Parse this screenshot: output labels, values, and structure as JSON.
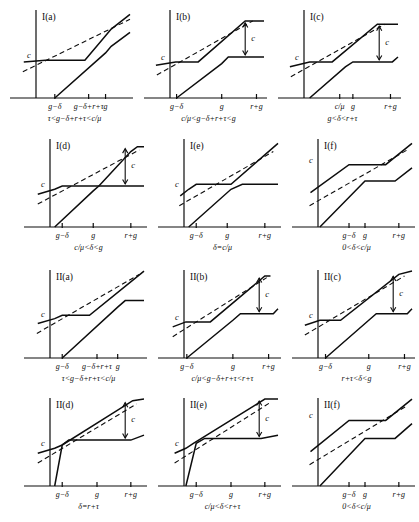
{
  "figure": {
    "kind": "piecewise-linear-case-diagrams",
    "panel_count": 12
  },
  "chart_data": {
    "type": "line",
    "title": "",
    "xlabel": "",
    "ylabel": "",
    "grid": false,
    "legend": "none",
    "panels": [
      {
        "id": "I-a",
        "title": "I(a)",
        "condition": "τ<g−δ+r+τ<c/μ",
        "level_label": "c",
        "has_c_bracket": false,
        "ticks": [
          "g−δ",
          "g−δ+r+τ",
          "g"
        ],
        "tick_x": [
          0.2,
          0.56,
          0.74
        ],
        "upper_series": {
          "name": "upper",
          "x": [
            -0.13,
            0.1,
            0.52,
            0.74,
            0.8,
            1.0
          ],
          "y": [
            0.44,
            0.46,
            0.46,
            0.76,
            0.84,
            1.02
          ]
        },
        "lower_series": {
          "name": "lower",
          "x": [
            0.2,
            0.74,
            0.8,
            1.0
          ],
          "y": [
            0.0,
            0.55,
            0.63,
            0.8
          ]
        },
        "dashed_series": {
          "name": "reference",
          "x": [
            -0.14,
            1.0
          ],
          "y": [
            0.32,
            0.96
          ]
        }
      },
      {
        "id": "I-b",
        "title": "I(b)",
        "condition": "c/μ<g−δ+r+τ<g",
        "level_label": "c",
        "has_c_bracket": true,
        "ticks": [
          "g−δ",
          "g",
          "r+g"
        ],
        "tick_x": [
          0.07,
          0.55,
          0.92
        ],
        "upper_series": {
          "name": "upper",
          "x": [
            -0.15,
            0.06,
            0.3,
            0.8,
            1.0
          ],
          "y": [
            0.4,
            0.44,
            0.44,
            0.94,
            0.94
          ]
        },
        "lower_series": {
          "name": "lower",
          "x": [
            0.07,
            0.55,
            0.62,
            1.0
          ],
          "y": [
            0.0,
            0.42,
            0.5,
            0.5
          ]
        },
        "dashed_series": {
          "name": "reference",
          "x": [
            -0.14,
            0.88
          ],
          "y": [
            0.28,
            0.94
          ]
        }
      },
      {
        "id": "I-c",
        "title": "I(c)",
        "condition": "g<δ<r+τ",
        "level_label": "c",
        "has_c_bracket": true,
        "ticks": [
          "c/μ",
          "g",
          "r+g"
        ],
        "tick_x": [
          0.38,
          0.52,
          0.92
        ],
        "upper_series": {
          "name": "upper",
          "x": [
            -0.15,
            0.06,
            0.3,
            0.78,
            1.0
          ],
          "y": [
            0.38,
            0.44,
            0.44,
            0.9,
            0.9
          ]
        },
        "lower_series": {
          "name": "lower",
          "x": [
            0.06,
            0.44,
            0.52,
            0.94,
            1.0
          ],
          "y": [
            0.0,
            0.38,
            0.44,
            0.44,
            0.5
          ]
        },
        "dashed_series": {
          "name": "reference",
          "x": [
            -0.14,
            0.86
          ],
          "y": [
            0.26,
            0.9
          ]
        }
      },
      {
        "id": "I-d",
        "title": "I(d)",
        "condition": "c/μ<δ<g",
        "level_label": "c",
        "has_c_bracket": true,
        "ticks": [
          "g−δ",
          "g",
          "r+g"
        ],
        "tick_x": [
          0.13,
          0.46,
          0.86
        ],
        "upper_series": {
          "name": "upper",
          "x": [
            -0.13,
            0.05,
            0.13,
            0.52,
            0.86,
            0.93,
            1.0
          ],
          "y": [
            0.4,
            0.46,
            0.5,
            0.5,
            0.92,
            0.98,
            0.98
          ]
        },
        "lower_series": {
          "name": "lower",
          "x": [
            0.05,
            0.46,
            0.52,
            0.86,
            1.0
          ],
          "y": [
            0.0,
            0.44,
            0.5,
            0.5,
            0.5
          ]
        },
        "dashed_series": {
          "name": "reference",
          "x": [
            -0.13,
            0.95
          ],
          "y": [
            0.28,
            0.94
          ]
        }
      },
      {
        "id": "I-e",
        "title": "I(e)",
        "condition": "δ=c/μ",
        "level_label": "c",
        "has_c_bracket": false,
        "ticks": [
          "g−δ",
          "g",
          "r+g"
        ],
        "tick_x": [
          0.13,
          0.46,
          0.86
        ],
        "upper_series": {
          "name": "upper",
          "x": [
            -0.04,
            0.05,
            0.13,
            0.5,
            1.0
          ],
          "y": [
            0.38,
            0.46,
            0.52,
            0.52,
            1.02
          ]
        },
        "lower_series": {
          "name": "lower",
          "x": [
            0.05,
            0.5,
            0.62,
            1.0
          ],
          "y": [
            0.0,
            0.46,
            0.52,
            0.52
          ]
        },
        "dashed_series": {
          "name": "reference",
          "x": [
            -0.05,
            0.95
          ],
          "y": [
            0.26,
            0.92
          ]
        }
      },
      {
        "id": "I-f",
        "title": "I(f)",
        "condition": "0<δ<c/μ",
        "level_label": "c",
        "has_c_bracket": false,
        "ticks": [
          "g−δ",
          "g",
          "r+g"
        ],
        "tick_x": [
          0.33,
          0.5,
          0.86
        ],
        "upper_series": {
          "name": "upper",
          "x": [
            -0.08,
            0.33,
            0.72,
            1.0
          ],
          "y": [
            0.42,
            0.76,
            0.76,
            1.02
          ]
        },
        "lower_series": {
          "name": "lower",
          "x": [
            0.02,
            0.5,
            0.82,
            1.0
          ],
          "y": [
            0.0,
            0.56,
            0.56,
            0.72
          ]
        },
        "dashed_series": {
          "name": "reference",
          "x": [
            -0.09,
            0.95
          ],
          "y": [
            0.26,
            0.94
          ]
        }
      },
      {
        "id": "II-a",
        "title": "II(a)",
        "condition": "τ<g−δ+r+τ<c/μ",
        "level_label": "c",
        "has_c_bracket": false,
        "ticks": [
          "g−δ",
          "g−δ+r+τ",
          "g"
        ],
        "tick_x": [
          0.13,
          0.5,
          0.72
        ],
        "upper_series": {
          "name": "upper",
          "x": [
            -0.13,
            0.05,
            0.13,
            0.42,
            1.0
          ],
          "y": [
            0.42,
            0.48,
            0.52,
            0.52,
            1.06
          ]
        },
        "lower_series": {
          "name": "lower",
          "x": [
            0.13,
            0.72,
            0.8,
            1.0
          ],
          "y": [
            0.0,
            0.62,
            0.7,
            0.7
          ]
        },
        "dashed_series": {
          "name": "reference",
          "x": [
            -0.14,
            0.95
          ],
          "y": [
            0.3,
            1.02
          ]
        }
      },
      {
        "id": "II-b",
        "title": "II(b)",
        "condition": "c/μ<g−δ+r+τ<r+τ",
        "level_label": "c",
        "has_c_bracket": true,
        "ticks": [
          "g−δ",
          "g",
          "r+g"
        ],
        "tick_x": [
          0.03,
          0.52,
          0.9
        ],
        "upper_series": {
          "name": "upper",
          "x": [
            -0.12,
            0.02,
            0.28,
            0.86,
            0.92
          ],
          "y": [
            0.38,
            0.44,
            0.44,
            1.0,
            1.0
          ]
        },
        "lower_series": {
          "name": "lower",
          "x": [
            0.03,
            0.52,
            0.6,
            0.95,
            1.0
          ],
          "y": [
            0.0,
            0.46,
            0.54,
            0.54,
            0.6
          ]
        },
        "dashed_series": {
          "name": "reference",
          "x": [
            -0.12,
            0.88
          ],
          "y": [
            0.26,
            0.98
          ]
        }
      },
      {
        "id": "II-c",
        "title": "II(c)",
        "condition": "r+τ<δ<g",
        "level_label": "c",
        "has_c_bracket": true,
        "ticks": [
          "g−δ",
          "g",
          "r+g"
        ],
        "tick_x": [
          0.08,
          0.54,
          0.92
        ],
        "upper_series": {
          "name": "upper",
          "x": [
            -0.14,
            0.02,
            0.24,
            0.86,
            1.0
          ],
          "y": [
            0.4,
            0.46,
            0.46,
            1.02,
            1.06
          ]
        },
        "lower_series": {
          "name": "lower",
          "x": [
            0.08,
            0.54,
            0.62,
            0.95,
            1.0
          ],
          "y": [
            0.0,
            0.46,
            0.54,
            0.54,
            0.6
          ]
        },
        "dashed_series": {
          "name": "reference",
          "x": [
            -0.14,
            0.92
          ],
          "y": [
            0.28,
            1.0
          ]
        }
      },
      {
        "id": "II-d",
        "title": "II(d)",
        "condition": "δ=r+τ",
        "level_label": "c",
        "has_c_bracket": true,
        "ticks": [
          "g−δ",
          "g",
          "r+g"
        ],
        "tick_x": [
          0.13,
          0.5,
          0.86
        ],
        "upper_series": {
          "name": "upper",
          "x": [
            -0.13,
            0.05,
            0.13,
            0.88,
            1.0
          ],
          "y": [
            0.4,
            0.46,
            0.5,
            1.04,
            1.06
          ]
        },
        "lower_series": {
          "name": "lower",
          "x": [
            0.05,
            0.13,
            0.2,
            0.86,
            1.0
          ],
          "y": [
            0.0,
            0.5,
            0.56,
            0.56,
            0.62
          ]
        },
        "dashed_series": {
          "name": "reference",
          "x": [
            -0.13,
            0.92
          ],
          "y": [
            0.28,
            1.0
          ]
        }
      },
      {
        "id": "II-e",
        "title": "II(e)",
        "condition": "c/μ<δ<r+τ",
        "level_label": "c",
        "has_c_bracket": true,
        "ticks": [
          "g−δ",
          "g",
          "r+g"
        ],
        "tick_x": [
          0.13,
          0.5,
          0.86
        ],
        "upper_series": {
          "name": "upper",
          "x": [
            -0.1,
            0.02,
            0.1,
            0.86,
            1.0
          ],
          "y": [
            0.4,
            0.46,
            0.52,
            1.06,
            1.06
          ]
        },
        "lower_series": {
          "name": "lower",
          "x": [
            0.02,
            0.13,
            0.22,
            0.82,
            1.0
          ],
          "y": [
            0.0,
            0.52,
            0.58,
            0.58,
            0.62
          ]
        },
        "dashed_series": {
          "name": "reference",
          "x": [
            -0.1,
            0.92
          ],
          "y": [
            0.28,
            1.02
          ]
        }
      },
      {
        "id": "II-f",
        "title": "II(f)",
        "condition": "0<δ<c/μ",
        "level_label": "c",
        "has_c_bracket": false,
        "ticks": [
          "g−δ",
          "g",
          "r+g"
        ],
        "tick_x": [
          0.33,
          0.5,
          0.86
        ],
        "upper_series": {
          "name": "upper",
          "x": [
            -0.08,
            0.33,
            0.72,
            1.0
          ],
          "y": [
            0.42,
            0.8,
            0.8,
            1.06
          ]
        },
        "lower_series": {
          "name": "lower",
          "x": [
            0.02,
            0.5,
            0.82,
            1.0
          ],
          "y": [
            0.0,
            0.58,
            0.58,
            0.76
          ]
        },
        "dashed_series": {
          "name": "reference",
          "x": [
            -0.09,
            0.95
          ],
          "y": [
            0.26,
            0.98
          ]
        }
      }
    ]
  }
}
